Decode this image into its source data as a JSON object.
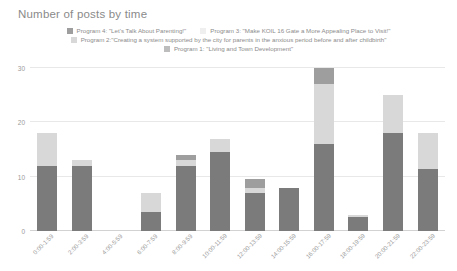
{
  "chart_data": {
    "type": "bar",
    "stacked": true,
    "title": "Number of posts by time",
    "xlabel": "",
    "ylabel": "",
    "ylim": [
      0,
      30
    ],
    "yticks": [
      0,
      10,
      20,
      30
    ],
    "grid": true,
    "legend_position": "top",
    "categories": [
      "0:00-1:59",
      "2:00-3:59",
      "4:00-5:59",
      "6:00-7:59",
      "8:00-9:59",
      "10:00-11:59",
      "12:00-13:59",
      "14:00-15:59",
      "16:00-17:59",
      "18:00-19:59",
      "20:00-21:59",
      "22:00-23:59"
    ],
    "series": [
      {
        "name": "Program 1: \"Living and Town Development\"",
        "color": "#7b7b7b",
        "values": [
          12,
          12,
          0,
          3.5,
          12,
          14.5,
          7,
          8,
          16,
          2.5,
          18,
          11.5
        ]
      },
      {
        "name": "Program 2:\"Creating a system supported by the city for parents in the anxious period before and after childbirth\"",
        "color": "#d8d8d8",
        "values": [
          6,
          1,
          0,
          3.5,
          1,
          2.5,
          1,
          0,
          11,
          0.5,
          7,
          6.5
        ]
      },
      {
        "name": "Program 3: \"Make KOIL 16 Gate a More Appealing Place to Visit!\"",
        "color": "#efefef",
        "values": [
          0,
          0,
          0,
          0,
          0,
          0,
          0,
          0,
          0,
          0,
          0,
          0
        ]
      },
      {
        "name": "Program 4: \"Let's Talk About Parenting!\"",
        "color": "#9e9e9e",
        "values": [
          0,
          0,
          0,
          0,
          1,
          0,
          1.5,
          0,
          3,
          0,
          0,
          0
        ]
      }
    ],
    "totals": [
      18,
      13,
      0,
      7,
      14,
      17,
      9.5,
      8,
      30,
      3,
      25,
      18
    ]
  },
  "legend": {
    "rows": [
      [
        {
          "label": "Program 4: \"Let's Talk About Parenting!\"",
          "color": "#9e9e9e",
          "swatch_name": "legend-swatch-program-4"
        },
        {
          "label": "Program 3: \"Make KOIL 16 Gate a More Appealing Place to Visit!\"",
          "color": "#efefef",
          "swatch_name": "legend-swatch-program-3"
        }
      ],
      [
        {
          "label": "Program 2:\"Creating a system supported by the city for parents in the anxious period before and after childbirth\"",
          "color": "#d8d8d8",
          "swatch_name": "legend-swatch-program-2"
        }
      ],
      [
        {
          "label": "Program 1: \"Living and Town Development\"",
          "color": "#bdbdbd",
          "swatch_name": "legend-swatch-program-1"
        }
      ]
    ]
  },
  "colors": {
    "background": "#ffffff",
    "gridline": "#e8e8e8",
    "axis": "#d2d2d2",
    "text": "#9a9a9a",
    "title": "#8a8a8a"
  }
}
